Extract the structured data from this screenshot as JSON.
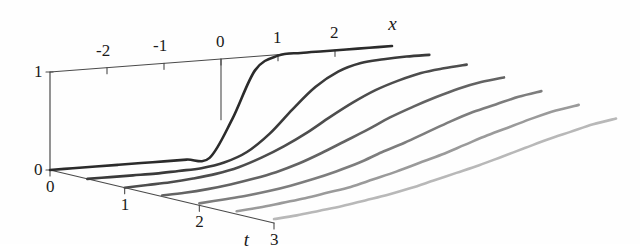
{
  "figure": {
    "background_color": "#fefefe",
    "axis_color": "#4a4a4a",
    "text_color": "#1a1a1a"
  },
  "axes": {
    "x": {
      "title": "x",
      "ticks": [
        "-2",
        "-1",
        "0",
        "1",
        "2"
      ],
      "range": [
        -3,
        3
      ]
    },
    "t": {
      "title": "t",
      "ticks": [
        "0",
        "1",
        "2",
        "3"
      ],
      "range": [
        0,
        3
      ]
    },
    "value": {
      "ticks": [
        "0",
        "1"
      ],
      "range": [
        0,
        1
      ]
    }
  },
  "chart_data": {
    "type": "line",
    "title": "",
    "xlabel": "x",
    "ylabel": "",
    "zlabel": "t",
    "xlim": [
      -3,
      3
    ],
    "ylim": [
      0,
      1
    ],
    "zlim": [
      0,
      3
    ],
    "grid": false,
    "legend": "none",
    "projection": "3d-waterfall",
    "x": [
      -3,
      -2.6,
      -2.2,
      -1.8,
      -1.4,
      -1,
      -0.6,
      -0.2,
      0.2,
      0.6,
      1,
      1.4,
      1.8,
      2.2,
      2.6,
      3
    ],
    "series": [
      {
        "name": "t = 0.0",
        "t": 0,
        "color": "#2b2b2b",
        "values": [
          0,
          0,
          0,
          0,
          0,
          0,
          0,
          0,
          0.38,
          0.86,
          0.99,
          1,
          1,
          1,
          1,
          1
        ]
      },
      {
        "name": "t = 0.5",
        "t": 0.5,
        "color": "#3a3a3a",
        "values": [
          0,
          0,
          0,
          0,
          0.01,
          0.02,
          0.06,
          0.15,
          0.32,
          0.55,
          0.76,
          0.9,
          0.97,
          0.99,
          1,
          1
        ]
      },
      {
        "name": "t = 1.0",
        "t": 1.0,
        "color": "#4d4d4d",
        "values": [
          0,
          0.01,
          0.02,
          0.04,
          0.07,
          0.12,
          0.2,
          0.3,
          0.42,
          0.56,
          0.69,
          0.8,
          0.88,
          0.94,
          0.97,
          0.99
        ]
      },
      {
        "name": "t = 1.5",
        "t": 1.5,
        "color": "#636363",
        "values": [
          0.01,
          0.02,
          0.04,
          0.07,
          0.11,
          0.16,
          0.23,
          0.32,
          0.42,
          0.52,
          0.63,
          0.72,
          0.8,
          0.87,
          0.92,
          0.95
        ]
      },
      {
        "name": "t = 2.0",
        "t": 2.0,
        "color": "#7d7d7d",
        "values": [
          0.02,
          0.04,
          0.06,
          0.09,
          0.13,
          0.18,
          0.24,
          0.31,
          0.4,
          0.48,
          0.57,
          0.66,
          0.74,
          0.8,
          0.86,
          0.9
        ]
      },
      {
        "name": "t = 2.5",
        "t": 2.5,
        "color": "#9a9a9a",
        "values": [
          0.03,
          0.05,
          0.08,
          0.11,
          0.15,
          0.19,
          0.25,
          0.31,
          0.38,
          0.45,
          0.53,
          0.61,
          0.68,
          0.75,
          0.81,
          0.85
        ]
      },
      {
        "name": "t = 3.0",
        "t": 3.0,
        "color": "#b8b8b8",
        "values": [
          0.04,
          0.06,
          0.09,
          0.12,
          0.16,
          0.2,
          0.25,
          0.31,
          0.37,
          0.43,
          0.5,
          0.57,
          0.64,
          0.7,
          0.76,
          0.8
        ]
      }
    ]
  }
}
